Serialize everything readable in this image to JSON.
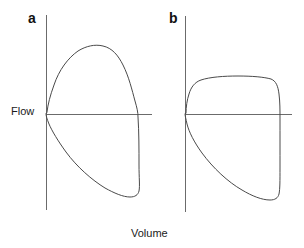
{
  "figure": {
    "type": "flow-volume-loop-diagram",
    "background_color": "#ffffff",
    "axis_color": "#6b6b6b",
    "curve_color": "#4a4a4a",
    "text_color": "#1a1a1a",
    "y_axis_label": "Flow",
    "x_axis_label": "Volume",
    "panels": [
      {
        "letter": "a",
        "description": "normal flow-volume loop",
        "origin": {
          "x": 46,
          "y": 114
        },
        "vertical_axis": {
          "x": 46,
          "y_top": 15,
          "y_bottom": 210
        },
        "horizontal_axis": {
          "y": 114,
          "x_left": 46,
          "x_right": 152
        },
        "expiratory_peak": {
          "x": 90,
          "y": 48
        },
        "expiratory_end": {
          "x": 137,
          "y": 114
        },
        "inspiratory_trough": {
          "x": 122,
          "y": 196
        },
        "loop_path": "M 47,112 C 48,104 50,96 54,85 C 59,70 68,58 78,51 C 86,46 95,44 103,46 C 112,48 118,55 123,65 C 129,77 132,90 135,101 C 137,108 138,112 138,117 C 139,132 139,150 139,165 C 139,178 140,186 139,191 C 138,195 135,197 130,197 C 123,197 114,193 105,188 C 92,180 77,167 66,152 C 58,141 52,131 49,124 C 47,119 46,116 46,114 Z"
      },
      {
        "letter": "b",
        "description": "obstructive flow-volume loop with flattened expiratory plateau",
        "origin": {
          "x": 185,
          "y": 114
        },
        "vertical_axis": {
          "x": 185,
          "y_top": 16,
          "y_bottom": 212
        },
        "horizontal_axis": {
          "y": 114,
          "x_left": 185,
          "x_right": 292
        },
        "expiratory_plateau": {
          "y": 79,
          "x_start": 205,
          "x_end": 268
        },
        "expiratory_end": {
          "x": 277,
          "y": 114
        },
        "inspiratory_trough": {
          "x": 265,
          "y": 199
        },
        "loop_path": "M 186,113 C 186,107 187,100 189,94 C 191,87 195,82 201,80 C 210,77 224,76 238,76 C 252,76 264,77 271,79 C 276,81 278,86 279,94 C 280,102 280,110 280,118 C 280,134 280,152 280,168 C 280,181 280,189 279,194 C 278,198 275,200 270,200 C 262,200 252,196 242,190 C 228,182 213,168 202,153 C 194,142 189,132 187,124 C 186,119 185,116 185,114 Z"
      }
    ]
  }
}
